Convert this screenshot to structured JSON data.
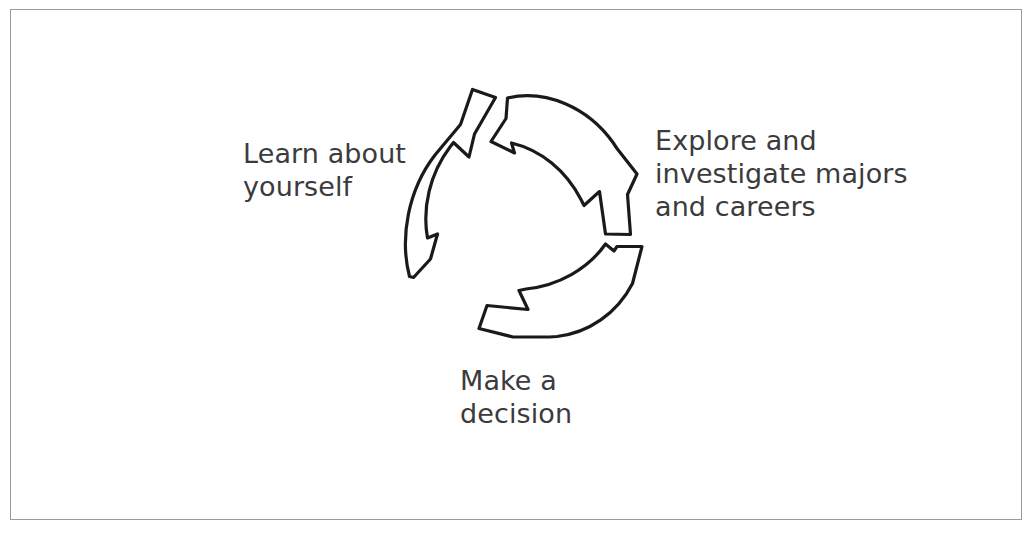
{
  "figure": {
    "type": "cycle-diagram",
    "background_color": "#ffffff",
    "frame_color": "#9a9a9e",
    "stroke_color": "#1a1a1a",
    "text_color": "#3b3b3d",
    "direction": "clockwise",
    "arrow_count": 3
  },
  "labels": {
    "learn": "Learn about\nyourself",
    "explore": "Explore and\ninvestigate majors\nand careers",
    "decide": "Make a\ndecision"
  },
  "icons": {
    "arrow_top_left": "curved-arrow-icon",
    "arrow_right": "curved-arrow-icon",
    "arrow_bottom": "curved-arrow-icon"
  }
}
